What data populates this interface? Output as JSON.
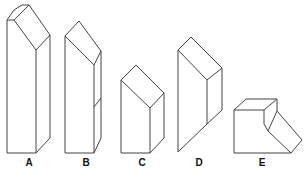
{
  "figure": {
    "stroke_color": "#444444",
    "shapes": [
      {
        "label": "A",
        "x": 29
      },
      {
        "label": "B",
        "x": 86
      },
      {
        "label": "C",
        "x": 142
      },
      {
        "label": "D",
        "x": 199
      },
      {
        "label": "E",
        "x": 262
      }
    ]
  }
}
